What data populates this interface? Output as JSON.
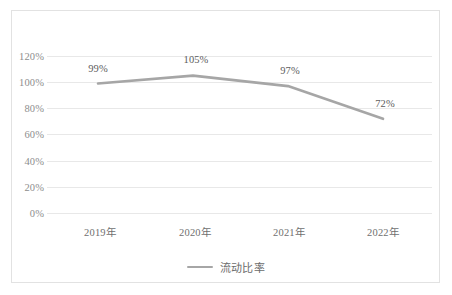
{
  "chart_data": {
    "type": "line",
    "title": "",
    "xlabel": "",
    "ylabel": "",
    "categories": [
      "2019年",
      "2020年",
      "2021年",
      "2022年"
    ],
    "series": [
      {
        "name": "流动比率",
        "values": [
          99,
          105,
          97,
          72
        ],
        "point_labels": [
          "99%",
          "105%",
          "97%",
          "72%"
        ],
        "color": "#a6a6a6"
      }
    ],
    "ylim": [
      0,
      120
    ],
    "ytick_values": [
      120,
      100,
      80,
      60,
      40,
      20,
      0
    ],
    "ytick_labels": [
      "120%",
      "100%",
      "80%",
      "60%",
      "40%",
      "20%",
      "0%"
    ],
    "grid": true,
    "legend_position": "bottom",
    "grid_color": "#e8e8e8",
    "frame_color": "#e2e2e2",
    "label_color": "#6f6f6f"
  },
  "legend": {
    "entries": [
      {
        "label": "流动比率"
      }
    ]
  },
  "axes": {
    "y_labels": [
      "120%",
      "100%",
      "80%",
      "60%",
      "40%",
      "20%",
      "0%"
    ],
    "x_labels": [
      "2019年",
      "2020年",
      "2021年",
      "2022年"
    ]
  },
  "data_labels": [
    "99%",
    "105%",
    "97%",
    "72%"
  ]
}
